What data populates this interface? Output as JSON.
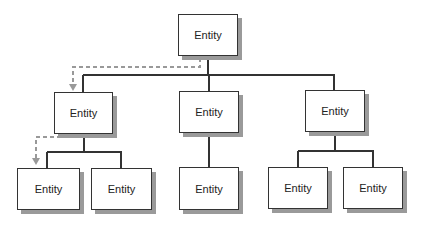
{
  "diagram": {
    "type": "hierarchy",
    "nodes": [
      {
        "id": "root",
        "label": "Entity"
      },
      {
        "id": "l1a",
        "label": "Entity"
      },
      {
        "id": "l1b",
        "label": "Entity"
      },
      {
        "id": "l1c",
        "label": "Entity"
      },
      {
        "id": "l2a1",
        "label": "Entity"
      },
      {
        "id": "l2a2",
        "label": "Entity"
      },
      {
        "id": "l2b1",
        "label": "Entity"
      },
      {
        "id": "l2c1",
        "label": "Entity"
      },
      {
        "id": "l2c2",
        "label": "Entity"
      }
    ],
    "edges": [
      {
        "from": "root",
        "to": "l1a",
        "style": "solid"
      },
      {
        "from": "root",
        "to": "l1b",
        "style": "solid"
      },
      {
        "from": "root",
        "to": "l1c",
        "style": "solid"
      },
      {
        "from": "l1a",
        "to": "l2a1",
        "style": "solid"
      },
      {
        "from": "l1a",
        "to": "l2a2",
        "style": "solid"
      },
      {
        "from": "l1b",
        "to": "l2b1",
        "style": "solid"
      },
      {
        "from": "l1c",
        "to": "l2c1",
        "style": "solid"
      },
      {
        "from": "l1c",
        "to": "l2c2",
        "style": "solid"
      },
      {
        "from": "root",
        "to": "l1a",
        "style": "dashed-arrow"
      },
      {
        "from": "l1a",
        "to": "l2a1",
        "style": "dashed-arrow"
      }
    ],
    "colors": {
      "line": "#333333",
      "dashed": "#999999",
      "shadow": "#9a9a9a"
    }
  }
}
